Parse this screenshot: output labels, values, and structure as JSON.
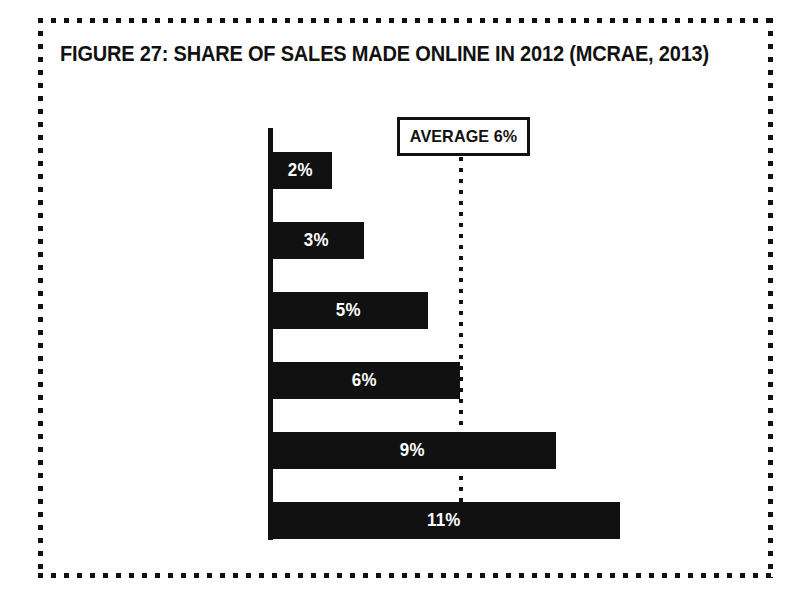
{
  "figure": {
    "title": "FIGURE 27: SHARE OF SALES MADE ONLINE IN 2012 (MCRAE, 2013)",
    "border_style": "dotted",
    "border_color": "#111111",
    "background": "#ffffff"
  },
  "annotation": {
    "average_label": "AVERAGE 6%",
    "average_value": 6,
    "line_style": "dotted",
    "box_border_color": "#111111",
    "box_fill": "#ffffff"
  },
  "chart_data": {
    "type": "bar",
    "orientation": "horizontal",
    "title": "FIGURE 27: SHARE OF SALES MADE ONLINE IN 2012 (MCRAE, 2013)",
    "xlabel": "",
    "ylabel": "",
    "categories": [
      "ITALY",
      "CHINA",
      "FRA",
      "GER",
      "US",
      "UK"
    ],
    "values": [
      2,
      3,
      5,
      6,
      9,
      11
    ],
    "value_labels": [
      "2%",
      "3%",
      "5%",
      "6%",
      "9%",
      "11%"
    ],
    "unit": "%",
    "xlim": [
      0,
      11
    ],
    "grid": false,
    "legend": false,
    "bar_color": "#111111",
    "value_label_color": "#ffffff",
    "annotations": [
      {
        "label": "AVERAGE 6%",
        "value": 6,
        "style": "dotted-vertical-line"
      }
    ]
  }
}
